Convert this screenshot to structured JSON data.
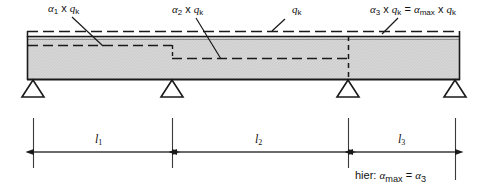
{
  "figure": {
    "beam": {
      "x_start": 27,
      "x_end": 460,
      "top_y": 36,
      "bottom_y": 80,
      "fill_color": "#d4d4d4",
      "edge_color": "#1a1a1a"
    },
    "load_line": {
      "label": "qk",
      "level_y": 32,
      "style": "dashed"
    },
    "supports": [
      {
        "name": "support-a",
        "x": 33
      },
      {
        "name": "support-b",
        "x": 172
      },
      {
        "name": "support-c",
        "x": 348
      },
      {
        "name": "support-d",
        "x": 455
      }
    ],
    "spans": [
      {
        "name": "span-1",
        "label_alpha": "α",
        "label_sub": "1",
        "label_full": "α₁ x qₖ",
        "load_level_y": 45,
        "x_from": 27,
        "x_to": 172
      },
      {
        "name": "span-2",
        "label_alpha": "α",
        "label_sub": "2",
        "label_full": "α₂ x qₖ",
        "load_level_y": 58,
        "x_from": 172,
        "x_to": 348
      },
      {
        "name": "span-3",
        "label_alpha": "α",
        "label_sub": "3",
        "label_full": "α₃ x qₖ = αₘₐₓ x qₖ",
        "load_level_y": 36,
        "x_from": 348,
        "x_to": 460
      }
    ],
    "labels": {
      "alpha1": {
        "alpha": "α",
        "sub": "1",
        "times": "x",
        "q": "q",
        "qsub": "k"
      },
      "alpha2": {
        "alpha": "α",
        "sub": "2",
        "times": "x",
        "q": "q",
        "qsub": "k"
      },
      "qk": {
        "q": "q",
        "qsub": "k"
      },
      "alpha3": {
        "alpha": "α",
        "sub": "3",
        "times": "x",
        "q": "q",
        "qsub": "k",
        "equals": "=",
        "alpha_max": "α",
        "max_sub": "max",
        "times2": "x",
        "q2": "q",
        "qsub2": "k"
      }
    },
    "dimensions": [
      {
        "name": "dim-l1",
        "symbol": "l",
        "sub": "1",
        "x_from": 33,
        "x_to": 172,
        "y": 152
      },
      {
        "name": "dim-l2",
        "symbol": "l",
        "sub": "2",
        "x_from": 172,
        "x_to": 348,
        "y": 152
      },
      {
        "name": "dim-l3",
        "symbol": "l",
        "sub": "3",
        "x_from": 348,
        "x_to": 455,
        "y": 152
      }
    ],
    "note": {
      "prefix": "hier:",
      "alpha_max": "α",
      "max_sub": "max",
      "equals": "=",
      "alpha3": "α",
      "a3_sub": "3"
    }
  }
}
